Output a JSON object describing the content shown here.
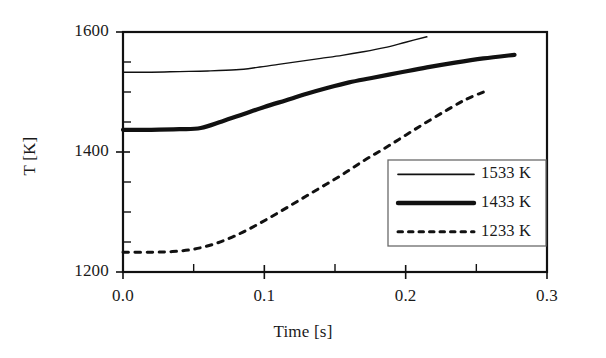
{
  "chart_data": {
    "type": "line",
    "title": "",
    "xlabel": "Time [s]",
    "ylabel": "T [K]",
    "xlim": [
      0.0,
      0.3
    ],
    "ylim": [
      1200,
      1600
    ],
    "xticks": [
      "0.0",
      "0.1",
      "0.2",
      "0.3"
    ],
    "xtick_values": [
      0.0,
      0.1,
      0.2,
      0.3
    ],
    "x_minor_tick_values": [
      0.05,
      0.15,
      0.25
    ],
    "yticks": [
      "1200",
      "1400",
      "1600"
    ],
    "ytick_values": [
      1200,
      1400,
      1600
    ],
    "y_minor_tick_values": [
      1250,
      1300,
      1350,
      1450,
      1500,
      1550
    ],
    "grid": false,
    "legend_position": "lower-right-inside",
    "frame": "box",
    "series": [
      {
        "name": "1533 K",
        "label": "1533 K",
        "style": "solid-thin",
        "color": "#111111",
        "width": 1.4,
        "points": [
          [
            0.0,
            1533
          ],
          [
            0.02,
            1533
          ],
          [
            0.04,
            1534
          ],
          [
            0.06,
            1535
          ],
          [
            0.08,
            1537
          ],
          [
            0.095,
            1541
          ],
          [
            0.11,
            1546
          ],
          [
            0.125,
            1551
          ],
          [
            0.14,
            1556
          ],
          [
            0.155,
            1561
          ],
          [
            0.17,
            1567
          ],
          [
            0.185,
            1574
          ],
          [
            0.2,
            1583
          ],
          [
            0.215,
            1592
          ]
        ]
      },
      {
        "name": "1433 K",
        "label": "1433 K",
        "style": "solid-thick",
        "color": "#111111",
        "width": 4.2,
        "points": [
          [
            0.0,
            1437
          ],
          [
            0.02,
            1437
          ],
          [
            0.04,
            1438
          ],
          [
            0.055,
            1440
          ],
          [
            0.07,
            1451
          ],
          [
            0.085,
            1463
          ],
          [
            0.1,
            1475
          ],
          [
            0.115,
            1486
          ],
          [
            0.13,
            1497
          ],
          [
            0.145,
            1507
          ],
          [
            0.16,
            1516
          ],
          [
            0.175,
            1523
          ],
          [
            0.195,
            1532
          ],
          [
            0.215,
            1541
          ],
          [
            0.235,
            1549
          ],
          [
            0.255,
            1556
          ],
          [
            0.277,
            1562
          ]
        ]
      },
      {
        "name": "1233 K",
        "label": "1233 K",
        "style": "dashed",
        "color": "#111111",
        "width": 3.0,
        "points": [
          [
            0.0,
            1233
          ],
          [
            0.02,
            1233
          ],
          [
            0.035,
            1234
          ],
          [
            0.05,
            1238
          ],
          [
            0.065,
            1247
          ],
          [
            0.08,
            1261
          ],
          [
            0.095,
            1279
          ],
          [
            0.11,
            1299
          ],
          [
            0.125,
            1320
          ],
          [
            0.14,
            1341
          ],
          [
            0.155,
            1362
          ],
          [
            0.17,
            1385
          ],
          [
            0.185,
            1406
          ],
          [
            0.2,
            1428
          ],
          [
            0.215,
            1450
          ],
          [
            0.23,
            1471
          ],
          [
            0.243,
            1488
          ],
          [
            0.255,
            1500
          ]
        ]
      }
    ]
  },
  "legend": {
    "entries": [
      {
        "label": "1533 K",
        "style": "solid-thin"
      },
      {
        "label": "1433 K",
        "style": "solid-thick"
      },
      {
        "label": "1233 K",
        "style": "dashed"
      }
    ]
  },
  "axes": {
    "x_title": "Time [s]",
    "y_title": "T [K]",
    "x_tick_labels": [
      "0.0",
      "0.1",
      "0.2",
      "0.3"
    ],
    "y_tick_labels": [
      "1200",
      "1400",
      "1600"
    ]
  },
  "colors": {
    "ink": "#111111",
    "background": "#ffffff"
  }
}
